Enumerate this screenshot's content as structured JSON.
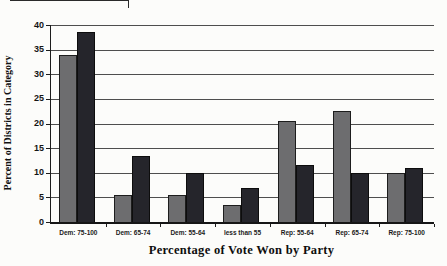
{
  "figure": {
    "background_color": "#fcfcfa",
    "gridline_color": "#4e4e4e",
    "axis_color": "#1c1c1c"
  },
  "chart_data": {
    "type": "bar",
    "title": "",
    "xlabel": "Percentage of Vote Won by Party",
    "ylabel": "Percent of Districts in Category",
    "categories": [
      "Dem: 75-100",
      "Dem: 65-74",
      "Dem: 55-64",
      "less than 55",
      "Rep: 55-64",
      "Rep: 65-74",
      "Rep: 75-100"
    ],
    "series": [
      {
        "name": "gray-series",
        "color": "#6d6d6f",
        "border_color": "#1d1d1d",
        "values": [
          34,
          5.5,
          5.5,
          3.5,
          20.5,
          22.5,
          10
        ]
      },
      {
        "name": "dark-series",
        "color": "#25252b",
        "border_color": "#0d0d0d",
        "values": [
          38.5,
          13.5,
          10,
          7,
          11.5,
          10,
          11
        ]
      }
    ],
    "ylim": [
      0,
      40
    ],
    "yticks": [
      0,
      5,
      10,
      15,
      20,
      25,
      30,
      35,
      40
    ],
    "grid": true,
    "legend": "none"
  }
}
